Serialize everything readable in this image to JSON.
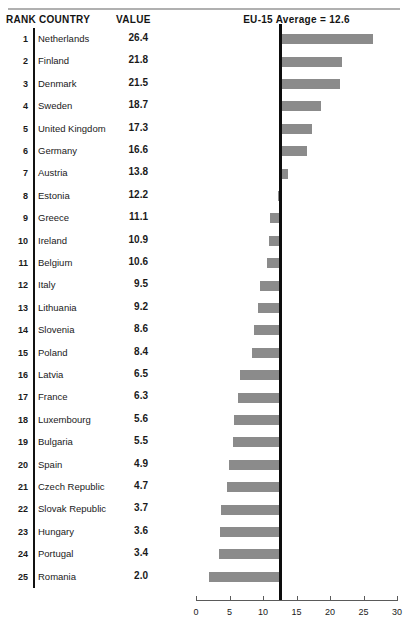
{
  "table": {
    "headers": {
      "rank": "RANK",
      "country": "COUNTRY",
      "value": "VALUE"
    }
  },
  "chart_header": {
    "title": "EU-15 Average = 12.6"
  },
  "colors": {
    "bar": "#8b8b8b",
    "reference_line": "#0d0d0d",
    "axis": "#5a5a5a",
    "rule": "#b0b0b0"
  },
  "chart_data": {
    "type": "bar",
    "orientation": "horizontal",
    "title": "EU-15 Average = 12.6",
    "xlabel": "",
    "ylabel": "",
    "xlim": [
      0,
      30
    ],
    "xticks": [
      0,
      5,
      10,
      15,
      20,
      25,
      30
    ],
    "grid": false,
    "legend": null,
    "baseline": 12.6,
    "baseline_label": "EU-15 Average = 12.6",
    "note": "Bars are anchored at the EU-15 average reference line (12.6) and extend right for values above it and left for values below it.",
    "categories": [
      "Netherlands",
      "Finland",
      "Denmark",
      "Sweden",
      "United Kingdom",
      "Germany",
      "Austria",
      "Estonia",
      "Greece",
      "Ireland",
      "Belgium",
      "Italy",
      "Lithuania",
      "Slovenia",
      "Poland",
      "Latvia",
      "France",
      "Luxembourg",
      "Bulgaria",
      "Spain",
      "Czech Republic",
      "Slovak Republic",
      "Hungary",
      "Portugal",
      "Romania"
    ],
    "values": [
      26.4,
      21.8,
      21.5,
      18.7,
      17.3,
      16.6,
      13.8,
      12.2,
      11.1,
      10.9,
      10.6,
      9.5,
      9.2,
      8.6,
      8.4,
      6.5,
      6.3,
      5.6,
      5.5,
      4.9,
      4.7,
      3.7,
      3.6,
      3.4,
      2.0
    ],
    "ranks": [
      1,
      2,
      3,
      4,
      5,
      6,
      7,
      8,
      9,
      10,
      11,
      12,
      13,
      14,
      15,
      16,
      17,
      18,
      19,
      20,
      21,
      22,
      23,
      24,
      25
    ],
    "rows": [
      {
        "rank": "1",
        "country": "Netherlands",
        "value": "26.4",
        "v": 26.4
      },
      {
        "rank": "2",
        "country": "Finland",
        "value": "21.8",
        "v": 21.8
      },
      {
        "rank": "3",
        "country": "Denmark",
        "value": "21.5",
        "v": 21.5
      },
      {
        "rank": "4",
        "country": "Sweden",
        "value": "18.7",
        "v": 18.7
      },
      {
        "rank": "5",
        "country": "United Kingdom",
        "value": "17.3",
        "v": 17.3
      },
      {
        "rank": "6",
        "country": "Germany",
        "value": "16.6",
        "v": 16.6
      },
      {
        "rank": "7",
        "country": "Austria",
        "value": "13.8",
        "v": 13.8
      },
      {
        "rank": "8",
        "country": "Estonia",
        "value": "12.2",
        "v": 12.2
      },
      {
        "rank": "9",
        "country": "Greece",
        "value": "11.1",
        "v": 11.1
      },
      {
        "rank": "10",
        "country": "Ireland",
        "value": "10.9",
        "v": 10.9
      },
      {
        "rank": "11",
        "country": "Belgium",
        "value": "10.6",
        "v": 10.6
      },
      {
        "rank": "12",
        "country": "Italy",
        "value": "9.5",
        "v": 9.5
      },
      {
        "rank": "13",
        "country": "Lithuania",
        "value": "9.2",
        "v": 9.2
      },
      {
        "rank": "14",
        "country": "Slovenia",
        "value": "8.6",
        "v": 8.6
      },
      {
        "rank": "15",
        "country": "Poland",
        "value": "8.4",
        "v": 8.4
      },
      {
        "rank": "16",
        "country": "Latvia",
        "value": "6.5",
        "v": 6.5
      },
      {
        "rank": "17",
        "country": "France",
        "value": "6.3",
        "v": 6.3
      },
      {
        "rank": "18",
        "country": "Luxembourg",
        "value": "5.6",
        "v": 5.6
      },
      {
        "rank": "19",
        "country": "Bulgaria",
        "value": "5.5",
        "v": 5.5
      },
      {
        "rank": "20",
        "country": "Spain",
        "value": "4.9",
        "v": 4.9
      },
      {
        "rank": "21",
        "country": "Czech Republic",
        "value": "4.7",
        "v": 4.7
      },
      {
        "rank": "22",
        "country": "Slovak Republic",
        "value": "3.7",
        "v": 3.7
      },
      {
        "rank": "23",
        "country": "Hungary",
        "value": "3.6",
        "v": 3.6
      },
      {
        "rank": "24",
        "country": "Portugal",
        "value": "3.4",
        "v": 3.4
      },
      {
        "rank": "25",
        "country": "Romania",
        "value": "2.0",
        "v": 2.0
      }
    ]
  }
}
